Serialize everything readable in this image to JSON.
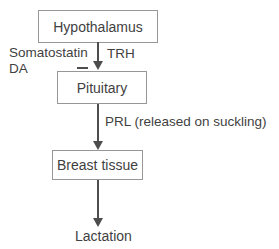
{
  "diagram": {
    "nodes": [
      {
        "id": "hypothalamus",
        "label": "Hypothalamus"
      },
      {
        "id": "pituitary",
        "label": "Pituitary"
      },
      {
        "id": "breast-tissue",
        "label": "Breast tissue"
      }
    ],
    "annotations": {
      "somatostatin": "Somatostatin",
      "da": "DA",
      "trh": "TRH",
      "prl": "PRL (released on suckling)",
      "lactation": "Lactation"
    },
    "icons": {
      "inhibition": "minus-icon",
      "flow": "arrow-down-icon"
    },
    "colors": {
      "background": "#ffffff",
      "box_border": "#979797",
      "arrow": "#4d4d4d",
      "text": "#3f3f3f"
    }
  }
}
